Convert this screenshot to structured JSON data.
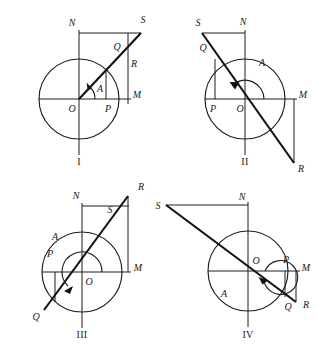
{
  "figure": {
    "stroke_color": "#1d1d1d",
    "background_color": "#ffffff",
    "panels": [
      {
        "id": "I",
        "roman_label": "I",
        "quadrant_note": "acute angle, terminal side in quadrant I",
        "center": {
          "cx": 79,
          "cy": 99
        },
        "radius": 40,
        "angle_deg": 48,
        "angle_arc_radius": 16,
        "points": [
          {
            "name": "N",
            "label": "N",
            "x": 72,
            "y": 26
          },
          {
            "name": "S",
            "label": "S",
            "x": 143,
            "y": 23
          },
          {
            "name": "Q",
            "label": "Q",
            "x": 117,
            "y": 50
          },
          {
            "name": "R",
            "label": "R",
            "x": 129,
            "y": 67
          },
          {
            "name": "M",
            "label": "M",
            "x": 131,
            "y": 98
          },
          {
            "name": "P",
            "label": "P",
            "x": 111,
            "y": 110
          },
          {
            "name": "O",
            "label": "O",
            "x": 72,
            "y": 110
          },
          {
            "name": "A",
            "label": "A",
            "x": 100,
            "y": 90
          }
        ]
      },
      {
        "id": "II",
        "roman_label": "II",
        "quadrant_note": "obtuse angle, terminal side in quadrant II",
        "center": {
          "cx": 245,
          "cy": 99
        },
        "radius": 40,
        "angle_deg": 138,
        "angle_arc_radius": 19,
        "points": [
          {
            "name": "S",
            "label": "S",
            "x": 198,
            "y": 26
          },
          {
            "name": "N",
            "label": "N",
            "x": 240,
            "y": 25
          },
          {
            "name": "Q",
            "label": "Q",
            "x": 196,
            "y": 48
          },
          {
            "name": "A",
            "label": "A",
            "x": 262,
            "y": 64
          },
          {
            "name": "M",
            "label": "M",
            "x": 297,
            "y": 98
          },
          {
            "name": "P",
            "label": "P",
            "x": 212,
            "y": 110
          },
          {
            "name": "O",
            "label": "O",
            "x": 238,
            "y": 110
          },
          {
            "name": "R",
            "label": "R",
            "x": 299,
            "y": 164
          }
        ]
      },
      {
        "id": "III",
        "roman_label": "III",
        "quadrant_note": "reflex angle, terminal side in quadrant III",
        "center": {
          "cx": 82,
          "cy": 272
        },
        "radius": 40,
        "angle_deg": 228,
        "angle_arc_radius": 20,
        "points": [
          {
            "name": "R",
            "label": "R",
            "x": 138,
            "y": 190
          },
          {
            "name": "N",
            "label": "N",
            "x": 76,
            "y": 199
          },
          {
            "name": "S",
            "label": "S",
            "x": 108,
            "y": 211
          },
          {
            "name": "A",
            "label": "A",
            "x": 55,
            "y": 240
          },
          {
            "name": "P",
            "label": "P",
            "x": 42,
            "y": 257
          },
          {
            "name": "M",
            "label": "M",
            "x": 134,
            "y": 271
          },
          {
            "name": "O",
            "label": "O",
            "x": 86,
            "y": 282
          },
          {
            "name": "Q",
            "label": "Q",
            "x": 34,
            "y": 315
          }
        ]
      },
      {
        "id": "IV",
        "roman_label": "IV",
        "quadrant_note": "reflex angle, terminal side in quadrant IV",
        "center": {
          "cx": 248,
          "cy": 271
        },
        "radius": 40,
        "angle_deg": 338,
        "angle_arc_radius": 17,
        "points": [
          {
            "name": "S",
            "label": "S",
            "x": 160,
            "y": 209
          },
          {
            "name": "N",
            "label": "N",
            "x": 242,
            "y": 200
          },
          {
            "name": "O",
            "label": "O",
            "x": 254,
            "y": 263
          },
          {
            "name": "P",
            "label": "P",
            "x": 286,
            "y": 261
          },
          {
            "name": "M",
            "label": "M",
            "x": 302,
            "y": 271
          },
          {
            "name": "A",
            "label": "A",
            "x": 224,
            "y": 294
          },
          {
            "name": "Q",
            "label": "Q",
            "x": 288,
            "y": 305
          },
          {
            "name": "R",
            "label": "R",
            "x": 304,
            "y": 303
          }
        ]
      }
    ],
    "roman_numerals": [
      {
        "text": "I",
        "x": 79,
        "y": 165
      },
      {
        "text": "II",
        "x": 245,
        "y": 165
      },
      {
        "text": "III",
        "x": 82,
        "y": 338
      },
      {
        "text": "IV",
        "x": 248,
        "y": 338
      }
    ]
  }
}
